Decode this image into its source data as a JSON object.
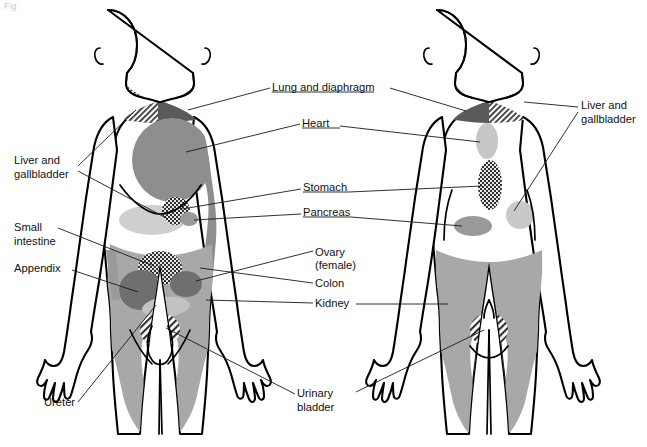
{
  "figure": {
    "corner_mark": "Fig",
    "views": [
      {
        "name": "anterior",
        "caption": "Anterior view"
      },
      {
        "name": "posterior",
        "caption": "Posterior view"
      }
    ]
  },
  "colors": {
    "outline": "#000000",
    "background": "#ffffff",
    "leader_line": "#1a1a1a",
    "text": "#111111",
    "zone_dark": "#5a5a5a",
    "zone_mid": "#8e8e8e",
    "zone_light": "#b4b4b4",
    "zone_pale": "#cfcfcf",
    "zone_very_pale": "#dedede",
    "hatch_diagonal": "#2e2e2e",
    "hatch_checker": "#2e2e2e"
  },
  "labels": [
    {
      "id": "lung-and-diaphragm",
      "text": "Lung and diaphragm",
      "lines": [
        "Lung and diaphragm"
      ],
      "x": 272,
      "y": 91,
      "anchor": "start",
      "side": "center",
      "organ": "lung and diaphragm",
      "pattern": "solid-dark",
      "views": [
        "anterior",
        "posterior"
      ]
    },
    {
      "id": "heart",
      "text": "Heart",
      "lines": [
        "Heart"
      ],
      "x": 302,
      "y": 127,
      "anchor": "start",
      "side": "center",
      "organ": "heart",
      "pattern": "solid-mid",
      "views": [
        "anterior",
        "posterior"
      ]
    },
    {
      "id": "stomach",
      "text": "Stomach",
      "lines": [
        "Stomach"
      ],
      "x": 303,
      "y": 191,
      "anchor": "start",
      "side": "center",
      "organ": "stomach",
      "pattern": "checker",
      "views": [
        "anterior",
        "posterior"
      ]
    },
    {
      "id": "pancreas",
      "text": "Pancreas",
      "lines": [
        "Pancreas"
      ],
      "x": 303,
      "y": 216,
      "anchor": "start",
      "side": "center",
      "organ": "pancreas",
      "pattern": "solid-light",
      "views": [
        "anterior",
        "posterior"
      ]
    },
    {
      "id": "ovary-female",
      "text": "Ovary (female)",
      "lines": [
        "Ovary",
        "(female)"
      ],
      "x": 315,
      "y": 256,
      "anchor": "start",
      "side": "center",
      "organ": "ovary",
      "pattern": "checker",
      "views": [
        "anterior"
      ]
    },
    {
      "id": "colon",
      "text": "Colon",
      "lines": [
        "Colon"
      ],
      "x": 315,
      "y": 285,
      "anchor": "start",
      "side": "center",
      "organ": "colon",
      "pattern": "solid-mid",
      "views": [
        "anterior"
      ]
    },
    {
      "id": "kidney",
      "text": "Kidney",
      "lines": [
        "Kidney"
      ],
      "x": 315,
      "y": 305,
      "anchor": "start",
      "side": "center",
      "organ": "kidney",
      "pattern": "solid-mid",
      "views": [
        "anterior",
        "posterior"
      ]
    },
    {
      "id": "liver-and-gallbladder-left",
      "text": "Liver and gallbladder",
      "lines": [
        "Liver and",
        "gallbladder"
      ],
      "x": 14,
      "y": 164,
      "anchor": "start",
      "side": "left",
      "organ": "liver and gallbladder",
      "pattern": "diagonal-hatch",
      "views": [
        "anterior",
        "posterior"
      ]
    },
    {
      "id": "small-intestine",
      "text": "Small intestine",
      "lines": [
        "Small",
        "intestine"
      ],
      "x": 14,
      "y": 231,
      "anchor": "start",
      "side": "left",
      "organ": "small intestine",
      "pattern": "checker",
      "views": [
        "anterior"
      ]
    },
    {
      "id": "appendix",
      "text": "Appendix",
      "lines": [
        "Appendix"
      ],
      "x": 14,
      "y": 272,
      "anchor": "start",
      "side": "left",
      "organ": "appendix",
      "pattern": "solid-mid",
      "views": [
        "anterior"
      ]
    },
    {
      "id": "ureter",
      "text": "Ureter",
      "lines": [
        "Ureter"
      ],
      "x": 44,
      "y": 403,
      "anchor": "start",
      "side": "left",
      "organ": "ureter",
      "pattern": "solid-mid",
      "views": [
        "anterior"
      ]
    },
    {
      "id": "urinary-bladder",
      "text": "Urinary bladder",
      "lines": [
        "Urinary",
        "bladder"
      ],
      "x": 297,
      "y": 397,
      "anchor": "start",
      "side": "center",
      "organ": "urinary bladder",
      "pattern": "diagonal-hatch",
      "views": [
        "anterior",
        "posterior"
      ]
    },
    {
      "id": "liver-and-gallbladder-right",
      "text": "Liver and gallbladder",
      "lines": [
        "Liver and",
        "gallbladder"
      ],
      "x": 581,
      "y": 109,
      "anchor": "start",
      "side": "right",
      "organ": "liver and gallbladder",
      "pattern": "solid-light",
      "views": [
        "posterior"
      ]
    }
  ]
}
